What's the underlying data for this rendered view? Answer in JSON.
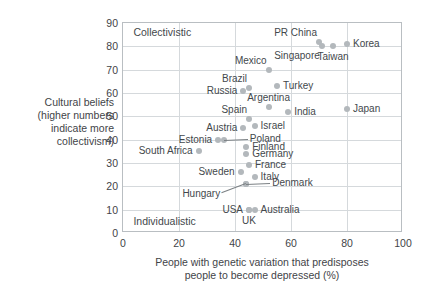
{
  "chart_data": {
    "type": "scatter",
    "title": "",
    "xlabel": "People with genetic variation that predisposes people to become depressed (%)",
    "ylabel": "Cultural beliefs (higher numbers indicate more collectivism)",
    "xlim": [
      0,
      100
    ],
    "ylim": [
      0,
      90
    ],
    "xticks": [
      0,
      20,
      40,
      60,
      80,
      100
    ],
    "yticks": [
      0,
      10,
      20,
      30,
      40,
      50,
      60,
      70,
      80,
      90
    ],
    "grid": true,
    "legend": "none",
    "annotations": [
      {
        "text": "Collectivistic",
        "x": 3,
        "y": 86,
        "align": "left"
      },
      {
        "text": "Individualistic",
        "x": 3,
        "y": 5,
        "align": "left"
      }
    ],
    "points": [
      {
        "label": "PR China",
        "x": 70,
        "y": 82,
        "label_pos": "above-left"
      },
      {
        "label": "Singapore",
        "x": 71,
        "y": 80,
        "label_pos": "below-left"
      },
      {
        "label": "Taiwan",
        "x": 75,
        "y": 80,
        "label_pos": "below"
      },
      {
        "label": "Korea",
        "x": 80,
        "y": 81,
        "label_pos": "right"
      },
      {
        "label": "Mexico",
        "x": 52,
        "y": 70,
        "label_pos": "above-left"
      },
      {
        "label": "Brazil",
        "x": 45,
        "y": 62,
        "label_pos": "above-left"
      },
      {
        "label": "Russia",
        "x": 43,
        "y": 61,
        "label_pos": "left"
      },
      {
        "label": "Turkey",
        "x": 55,
        "y": 63,
        "label_pos": "right"
      },
      {
        "label": "Argentina",
        "x": 52,
        "y": 54,
        "label_pos": "above"
      },
      {
        "label": "India",
        "x": 59,
        "y": 52,
        "label_pos": "right"
      },
      {
        "label": "Japan",
        "x": 80,
        "y": 53,
        "label_pos": "right"
      },
      {
        "label": "Spain",
        "x": 45,
        "y": 49,
        "label_pos": "above-left"
      },
      {
        "label": "Israel",
        "x": 47,
        "y": 46,
        "label_pos": "right"
      },
      {
        "label": "Austria",
        "x": 43,
        "y": 45,
        "label_pos": "left"
      },
      {
        "label": "Poland",
        "x": 36,
        "y": 40,
        "label_pos": "leader-right"
      },
      {
        "label": "Estonia",
        "x": 34,
        "y": 40,
        "label_pos": "left"
      },
      {
        "label": "Finland",
        "x": 44,
        "y": 37,
        "label_pos": "right"
      },
      {
        "label": "South Africa",
        "x": 27,
        "y": 35,
        "label_pos": "left"
      },
      {
        "label": "Germany",
        "x": 44,
        "y": 34,
        "label_pos": "right"
      },
      {
        "label": "France",
        "x": 45,
        "y": 29,
        "label_pos": "right"
      },
      {
        "label": "Sweden",
        "x": 42,
        "y": 26,
        "label_pos": "left"
      },
      {
        "label": "Italy",
        "x": 47,
        "y": 24,
        "label_pos": "right"
      },
      {
        "label": "Hungary",
        "x": 44,
        "y": 21,
        "label_pos": "leader-left"
      },
      {
        "label": "Denmark",
        "x": 44,
        "y": 21,
        "label_pos": "leader-right"
      },
      {
        "label": "USA",
        "x": 45,
        "y": 10,
        "label_pos": "left"
      },
      {
        "label": "Australia",
        "x": 47,
        "y": 10,
        "label_pos": "right"
      },
      {
        "label": "UK",
        "x": 45,
        "y": 10,
        "label_pos": "below"
      }
    ]
  },
  "axes": {
    "y_title_lines": [
      "Cultural beliefs",
      "(higher numbers",
      "indicate more",
      "collectivism)"
    ],
    "x_title_lines": [
      "People with genetic variation that predisposes",
      "people to become depressed (%)"
    ],
    "yticks": [
      "0",
      "10",
      "20",
      "30",
      "40",
      "50",
      "60",
      "70",
      "80",
      "90"
    ],
    "xticks": [
      "0",
      "20",
      "40",
      "60",
      "80",
      "100"
    ]
  },
  "corners": {
    "top_left": "Collectivistic",
    "bottom_left": "Individualistic"
  },
  "colors": {
    "point": "#b3b8bc",
    "frame": "#b9bec2",
    "grid": "#d5d9dc",
    "text": "#3f4448",
    "background": "#ffffff"
  }
}
